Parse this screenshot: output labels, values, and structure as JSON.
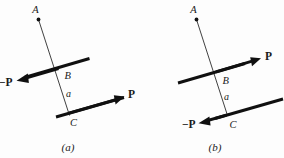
{
  "figure": {
    "title_alt": "Two-panel mechanics diagram of a bar with equal and opposite forces P applied at points B and C",
    "background_color": "#fdfdfd",
    "ink_color": "#101010",
    "panels": [
      {
        "id": "a",
        "caption": "(a)",
        "points": [
          {
            "name": "A",
            "label": "A"
          },
          {
            "name": "B",
            "label": "B"
          },
          {
            "name": "C",
            "label": "C"
          }
        ],
        "segment_label": "a",
        "vectors": [
          {
            "name": "upper-force",
            "label": "−P",
            "direction": "left-down",
            "applied_at": "B"
          },
          {
            "name": "lower-force",
            "label": "P",
            "direction": "right-up",
            "applied_at": "C"
          }
        ]
      },
      {
        "id": "b",
        "caption": "(b)",
        "points": [
          {
            "name": "A",
            "label": "A"
          },
          {
            "name": "B",
            "label": "B"
          },
          {
            "name": "C",
            "label": "C"
          }
        ],
        "segment_label": "a",
        "vectors": [
          {
            "name": "upper-force",
            "label": "P",
            "direction": "right-up",
            "applied_at": "B"
          },
          {
            "name": "lower-force",
            "label": "−P",
            "direction": "left-down",
            "applied_at": "C"
          }
        ]
      }
    ]
  }
}
